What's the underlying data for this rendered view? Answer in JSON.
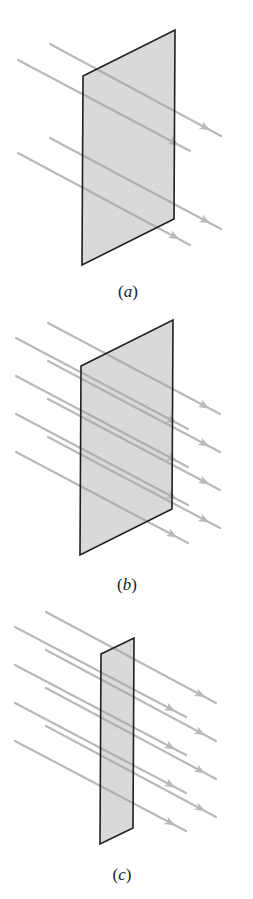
{
  "figure": {
    "colors": {
      "background": "#ffffff",
      "plane_fill": "#cdcdcd",
      "plane_border": "#1f1f1f",
      "arrow": "#b9b9b9",
      "arrow_on_plane": "#a4a4a4"
    },
    "panels": [
      {
        "id": "a",
        "label_open": "(",
        "label_letter": "a",
        "label_close": ")",
        "label_pos": [
          128,
          282
        ],
        "plane": [
          [
            83,
            76
          ],
          [
            175,
            30
          ],
          [
            174,
            219
          ],
          [
            82,
            265
          ]
        ],
        "arrow_count": 4,
        "arrows": [
          {
            "from": [
              50,
              44
            ],
            "to": [
              221,
              136
            ]
          },
          {
            "from": [
              18,
              60
            ],
            "to": [
              190,
              151
            ]
          },
          {
            "from": [
              50,
              138
            ],
            "to": [
              221,
              229
            ]
          },
          {
            "from": [
              18,
              153
            ],
            "to": [
              190,
              245
            ]
          }
        ]
      },
      {
        "id": "b",
        "label_open": "(",
        "label_letter": "b",
        "label_close": ")",
        "label_pos": [
          127,
          575
        ],
        "plane": [
          [
            81,
            366
          ],
          [
            173,
            320
          ],
          [
            172,
            509
          ],
          [
            80,
            555
          ]
        ],
        "arrow_count": 8,
        "arrows": [
          {
            "from": [
              48,
              323
            ],
            "to": [
              220,
              414
            ]
          },
          {
            "from": [
              16,
              338
            ],
            "to": [
              188,
              429
            ]
          },
          {
            "from": [
              48,
              361
            ],
            "to": [
              220,
              452
            ]
          },
          {
            "from": [
              16,
              376
            ],
            "to": [
              188,
              467
            ]
          },
          {
            "from": [
              48,
              399
            ],
            "to": [
              220,
              490
            ]
          },
          {
            "from": [
              16,
              414
            ],
            "to": [
              188,
              505
            ]
          },
          {
            "from": [
              48,
              437
            ],
            "to": [
              220,
              528
            ]
          },
          {
            "from": [
              16,
              452
            ],
            "to": [
              188,
              543
            ]
          }
        ]
      },
      {
        "id": "c",
        "label_open": "(",
        "label_letter": "c",
        "label_close": ")",
        "label_pos": [
          122,
          865
        ],
        "plane": [
          [
            101,
            654
          ],
          [
            134,
            638
          ],
          [
            133,
            828
          ],
          [
            100,
            844
          ]
        ],
        "arrow_count": 8,
        "arrows": [
          {
            "from": [
              46,
              612
            ],
            "to": [
              216,
              703
            ]
          },
          {
            "from": [
              15,
              627
            ],
            "to": [
              186,
              717
            ]
          },
          {
            "from": [
              46,
              650
            ],
            "to": [
              216,
              741
            ]
          },
          {
            "from": [
              15,
              665
            ],
            "to": [
              186,
              755
            ]
          },
          {
            "from": [
              46,
              688
            ],
            "to": [
              216,
              779
            ]
          },
          {
            "from": [
              15,
              703
            ],
            "to": [
              186,
              793
            ]
          },
          {
            "from": [
              46,
              726
            ],
            "to": [
              216,
              817
            ]
          },
          {
            "from": [
              15,
              741
            ],
            "to": [
              186,
              831
            ]
          }
        ]
      }
    ]
  }
}
